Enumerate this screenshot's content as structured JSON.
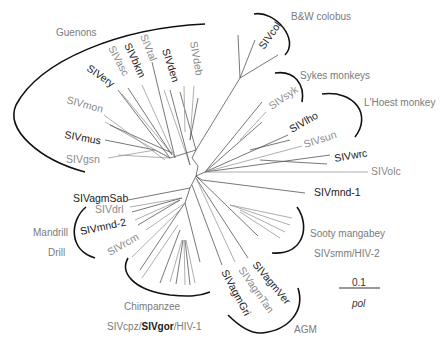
{
  "figure": {
    "type": "unrooted phylogenetic tree",
    "gene": "pol",
    "scale_bar": "0.1"
  },
  "groups": {
    "guenons": "Guenons",
    "bw_colobus": "B&W colobus",
    "sykes": "Sykes monkeys",
    "lhoest": "L'Hoest monkey",
    "sooty": "Sooty mangabey",
    "sooty_sub": "SIVsmm/HIV-2",
    "agm": "AGM",
    "chimp": "Chimpanzee",
    "chimp_sub_a": "SIVcpz/",
    "chimp_sub_b": "SIVgor",
    "chimp_sub_c": "/HIV-1",
    "mandrill": "Mandrill",
    "drill": "Drill"
  },
  "taxa": {
    "gsn": "SIVgsn",
    "mus": "SIVmus",
    "mon": "SIVmon",
    "ery": "SIVery",
    "asc": "SIVasc",
    "bkm": "SIVbkm",
    "tal": "SIVtal",
    "den": "SIVden",
    "deb": "SIVdeb",
    "col": "SIVcol",
    "syk": "SIVsyk",
    "lho": "SIVlho",
    "sun": "SIVsun",
    "wrc": "SIVwrc",
    "olc": "SIVolc",
    "mnd1": "SIVmnd-1",
    "agmVer": "SIVagmVer",
    "agmTan": "SIVagmTan",
    "agmGri": "SIVagmGri",
    "agmSab": "SIVagmSab",
    "drl": "SIVdrl",
    "mnd2": "SIVmnd-2",
    "rcm": "SIVrcm"
  }
}
